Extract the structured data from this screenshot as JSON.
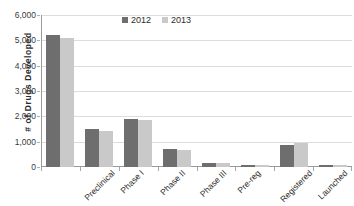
{
  "chart_data": {
    "type": "bar",
    "title": "",
    "xlabel": "",
    "ylabel": "# of Drugs Developed",
    "ylim": [
      0,
      6000
    ],
    "ytick_labels": [
      "6,000",
      "5,000",
      "4,000",
      "3,000",
      "2,000",
      "1,000",
      "0"
    ],
    "ytick_values": [
      6000,
      5000,
      4000,
      3000,
      2000,
      1000,
      0
    ],
    "grid": true,
    "legend_position": "top-center",
    "categories": [
      "Preclinical",
      "Phase I",
      "Phase II",
      "Phase III",
      "Pre-reg",
      "Registered",
      "Launched",
      "Suspended"
    ],
    "series": [
      {
        "name": "2012",
        "color": "#6e6e6e",
        "values": [
          5230,
          1490,
          1880,
          700,
          140,
          70,
          880,
          90
        ]
      },
      {
        "name": "2013",
        "color": "#c9c9c9",
        "values": [
          5090,
          1430,
          1870,
          690,
          150,
          60,
          940,
          80
        ]
      }
    ]
  },
  "legend": {
    "items": [
      {
        "label": "2012"
      },
      {
        "label": "2013"
      }
    ]
  },
  "axis": {
    "y_title": "# of Drugs Developed"
  },
  "colors": {
    "series_2012": "#6e6e6e",
    "series_2013": "#c9c9c9",
    "gridline": "#dcdcdc",
    "axis": "#9a9a9a",
    "background": "#ffffff"
  }
}
